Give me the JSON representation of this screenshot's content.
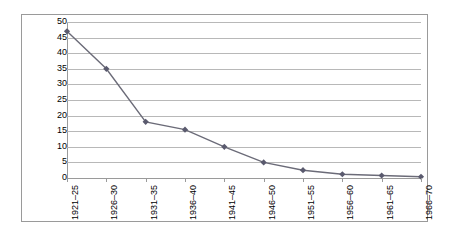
{
  "chart_data": {
    "type": "line",
    "title": "",
    "subtitle": "",
    "xlabel": "",
    "ylabel": "",
    "categories": [
      "1921–25",
      "1926–30",
      "1931–35",
      "1936–40",
      "1941–45",
      "1946–50",
      "1951–55",
      "1956–60",
      "1961–65",
      "1966–70"
    ],
    "values": [
      47,
      35,
      18,
      15.5,
      10,
      5,
      2.5,
      1.2,
      0.8,
      0.4
    ],
    "series": [
      {
        "name": "Series 1",
        "values": [
          47,
          35,
          18,
          15.5,
          10,
          5,
          2.5,
          1.2,
          0.8,
          0.4
        ]
      }
    ],
    "ylim": [
      0,
      50
    ],
    "ytick_labels": [
      "50",
      "45",
      "40",
      "35",
      "30",
      "25",
      "20",
      "15",
      "10",
      "5",
      "0"
    ],
    "ytick_values": [
      50,
      45,
      40,
      35,
      30,
      25,
      20,
      15,
      10,
      5,
      0
    ],
    "ytick_step": 5,
    "grid": true,
    "grid_axis": "y",
    "legend": false,
    "legend_position": "none",
    "marker": "diamond",
    "annotations": []
  },
  "style": {
    "line_color": "#6b6b78",
    "marker_color": "#5a5a6e",
    "grid_color": "#b8b8b8",
    "axis_color": "#9a9a9a",
    "frame_color": "#9a9a9a",
    "background": "#ffffff",
    "text_color": "#000000"
  }
}
